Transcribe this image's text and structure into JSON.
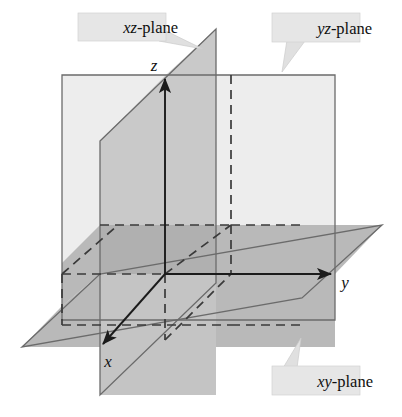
{
  "figure": {
    "width": 402,
    "height": 417,
    "background_color": "#ffffff"
  },
  "axes": {
    "origin": {
      "x": 165,
      "y": 274
    },
    "items": [
      {
        "name": "x-axis",
        "label": "x",
        "label_x": 108,
        "label_y": 367,
        "direction": "down-left",
        "from": {
          "x": 165,
          "y": 274
        },
        "to": {
          "x": 100,
          "y": 347
        },
        "arrowhead": true
      },
      {
        "name": "y-axis",
        "label": "y",
        "label_x": 345,
        "label_y": 288,
        "direction": "right",
        "from": {
          "x": 165,
          "y": 274
        },
        "to": {
          "x": 333,
          "y": 274
        },
        "arrowhead": true
      },
      {
        "name": "z-axis",
        "label": "z",
        "label_x": 154,
        "label_y": 71,
        "direction": "up",
        "from": {
          "x": 165,
          "y": 274
        },
        "to": {
          "x": 165,
          "y": 77
        },
        "arrowhead": true
      }
    ]
  },
  "planes": [
    {
      "name": "xy-plane",
      "label_prefix": "xy",
      "label_suffix": "-plane",
      "fill_color": "#b9b9b9",
      "edge_color": "#6b6b6b",
      "description": "horizontal parallelogram through origin"
    },
    {
      "name": "yz-plane",
      "label_prefix": "yz",
      "label_suffix": "-plane",
      "fill_color": "#ededed",
      "edge_color": "#6b6b6b",
      "description": "vertical rectangle facing viewer"
    },
    {
      "name": "xz-plane",
      "label_prefix": "xz",
      "label_suffix": "-plane",
      "fill_color": "#c9c9c9",
      "edge_color": "#6b6b6b",
      "description": "vertical parallelogram receding into depth"
    }
  ],
  "callouts": [
    {
      "name": "xz-plane-callout",
      "prefix": "xz",
      "suffix": "-plane",
      "box_x": 78,
      "box_y": 14,
      "box_w": 87,
      "box_h": 26,
      "text_x": 86,
      "text_y": 33,
      "tail": "165,30 200,47 164,40"
    },
    {
      "name": "yz-plane-callout",
      "prefix": "yz",
      "suffix": "-plane",
      "box_x": 272,
      "box_y": 14,
      "box_w": 87,
      "box_h": 28,
      "text_x": 280,
      "text_y": 34,
      "tail": "288,41 284,70 303,42"
    },
    {
      "name": "xy-plane-callout",
      "prefix": "xy",
      "suffix": "-plane",
      "box_x": 272,
      "box_y": 367,
      "box_w": 87,
      "box_h": 28,
      "text_x": 280,
      "text_y": 388,
      "tail": "284,367 300,340 298,367"
    }
  ],
  "colors": {
    "light_gray": "#ededed",
    "mid_gray": "#c9c9c9",
    "dark_gray": "#b9b9b9",
    "overlap_gray": "#b0b0b0",
    "edge_stroke": "#6b6b6b",
    "axis_stroke": "#1b1b1b",
    "dash_stroke": "#3a3a3a",
    "callout_fill": "#e6e6e6"
  }
}
